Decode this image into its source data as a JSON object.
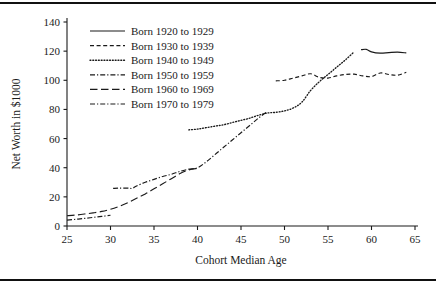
{
  "chart_data": {
    "type": "line",
    "title": "",
    "xlabel": "Cohort Median Age",
    "ylabel": "Net Worth in $1000",
    "xlim": [
      25,
      65
    ],
    "ylim": [
      0,
      140
    ],
    "xticks": [
      25,
      30,
      35,
      40,
      45,
      50,
      55,
      60,
      65
    ],
    "yticks": [
      0,
      20,
      40,
      60,
      80,
      100,
      120,
      140
    ],
    "grid": false,
    "legend_position": "upper-left-inside",
    "series": [
      {
        "name": "Born 1920 to 1929",
        "style": "solid",
        "x": [
          58.8,
          59.4,
          60.0,
          61.0,
          62.0,
          63.0,
          64.0
        ],
        "y": [
          121.0,
          121.2,
          119.5,
          118.6,
          119.0,
          119.3,
          118.8
        ]
      },
      {
        "name": "Born 1930 to 1939",
        "style": "dashed",
        "x": [
          49.0,
          50.0,
          51.0,
          52.0,
          53.0,
          54.0,
          55.0,
          56.0,
          57.0,
          58.0,
          59.0,
          60.0,
          61.0,
          62.0,
          63.0,
          64.0
        ],
        "y": [
          99.6,
          100.0,
          101.5,
          103.0,
          104.5,
          102.0,
          101.5,
          103.0,
          104.0,
          104.2,
          103.0,
          102.5,
          105.0,
          104.0,
          103.5,
          105.5
        ]
      },
      {
        "name": "Born 1940 to 1949",
        "style": "dotted",
        "x": [
          39.0,
          40.0,
          41.0,
          42.0,
          43.0,
          44.0,
          45.0,
          46.0,
          47.0,
          48.0,
          49.0,
          50.0,
          51.0,
          52.0,
          53.0,
          54.0,
          55.0,
          56.0,
          57.0,
          58.0
        ],
        "y": [
          66.0,
          66.5,
          67.5,
          68.5,
          69.5,
          71.0,
          72.5,
          74.0,
          76.0,
          77.5,
          78.0,
          79.0,
          81.0,
          85.0,
          93.0,
          99.0,
          104.0,
          109.0,
          114.0,
          119.5
        ]
      },
      {
        "name": "Born 1950 to 1959",
        "style": "dashdot",
        "x": [
          39.0,
          40.0,
          41.0,
          42.0,
          43.0,
          44.0,
          45.0,
          46.0,
          47.0,
          48.0
        ],
        "y": [
          39.0,
          40.0,
          44.0,
          49.0,
          54.0,
          59.0,
          64.0,
          69.0,
          74.0,
          78.5
        ]
      },
      {
        "name": "Born 1960 to 1969",
        "style": "longdash",
        "x": [
          25.0,
          26.0,
          27.0,
          28.0,
          29.0,
          30.0,
          31.0,
          32.0,
          33.0,
          34.0,
          35.0,
          36.0,
          37.0,
          38.0,
          39.0,
          40.0
        ],
        "y": [
          7.0,
          7.5,
          8.2,
          9.0,
          10.0,
          11.5,
          13.5,
          16.0,
          19.0,
          22.0,
          25.5,
          29.0,
          32.5,
          36.0,
          38.5,
          39.5
        ]
      },
      {
        "name": "Born 1970 to 1979",
        "style": "dashdot",
        "x": [
          25.0,
          26.0,
          27.0,
          28.0,
          29.0,
          30.0,
          30.3,
          31.0,
          32.0,
          32.5,
          33.0,
          34.0,
          35.0,
          36.0,
          37.0,
          38.0,
          39.0
        ],
        "y": [
          4.0,
          4.6,
          5.2,
          5.9,
          6.6,
          7.4,
          25.8,
          26.0,
          26.0,
          25.8,
          27.5,
          30.0,
          32.0,
          34.0,
          35.5,
          37.5,
          39.0
        ]
      }
    ],
    "legend": [
      {
        "label": "Born 1920 to 1929",
        "style": "solid"
      },
      {
        "label": "Born 1930 to 1939",
        "style": "dashed"
      },
      {
        "label": "Born 1940 to 1949",
        "style": "dotted"
      },
      {
        "label": "Born 1950 to 1959",
        "style": "dashdot"
      },
      {
        "label": "Born 1960 to 1969",
        "style": "longdash"
      },
      {
        "label": "Born 1970 to 1979",
        "style": "dashdot"
      }
    ],
    "line_color": "#1a1a1a"
  }
}
